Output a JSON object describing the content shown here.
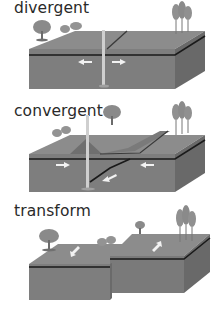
{
  "diagrams": [
    {
      "label": "divergent",
      "arrows": [
        "left",
        "right"
      ],
      "features": [
        "magma-plume",
        "rift",
        "trees"
      ]
    },
    {
      "label": "convergent",
      "arrows": [
        "right",
        "left",
        "subducting"
      ],
      "features": [
        "volcano",
        "subduction-zone",
        "trees"
      ]
    },
    {
      "label": "transform",
      "arrows": [
        "down-left",
        "up-right"
      ],
      "features": [
        "offset-fault",
        "trees"
      ]
    }
  ],
  "colors": {
    "top_surface": "#8a8a8a",
    "front_face": "#7d7d7d",
    "side_face": "#6a6a6a",
    "crust_line": "#1a1a1a",
    "tree": "#8f8f8f",
    "arrow": "#f2f2f2",
    "text": "#2a2a2a"
  }
}
